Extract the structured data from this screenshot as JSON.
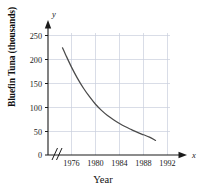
{
  "chart_data": {
    "type": "line",
    "title": "",
    "xlabel": "Year",
    "ylabel": "Bluefin Tuna (thousands)",
    "x_axis_variable": "y",
    "y_axis_variable": "x",
    "axis_break": "//",
    "grid": true,
    "legend": "none",
    "xlim": [
      1974,
      1993
    ],
    "ylim": [
      0,
      265
    ],
    "xticks": [
      "1976",
      "1980",
      "1984",
      "1988",
      "1992"
    ],
    "xtick_values": [
      1976,
      1980,
      1984,
      1988,
      1992
    ],
    "yticks": [
      "0",
      "50",
      "100",
      "150",
      "200",
      "250"
    ],
    "ytick_values": [
      0,
      50,
      100,
      150,
      200,
      250
    ],
    "series": [
      {
        "name": "Bluefin Tuna population",
        "x": [
          1974.5,
          1975,
          1976,
          1977,
          1978,
          1979,
          1980,
          1981,
          1982,
          1983,
          1984,
          1985,
          1986,
          1987,
          1988,
          1989,
          1990
        ],
        "values": [
          228,
          214,
          187,
          163,
          142,
          124,
          108,
          95,
          84,
          75,
          67,
          60,
          54,
          48,
          43,
          38,
          31
        ]
      }
    ],
    "colors": {
      "curve": "#4a4a4a",
      "grid": "#c8cfdc",
      "axis": "#1a1a1a",
      "background": "#ffffff"
    }
  }
}
